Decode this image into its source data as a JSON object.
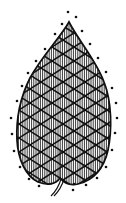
{
  "illustration": {
    "subject": "leaf-shaped crosshatch drawing with dotted outline",
    "colors": {
      "ink": "#111111",
      "background": "#ffffff"
    },
    "dots": [
      [
        68,
        12
      ],
      [
        76,
        17
      ],
      [
        62,
        24
      ],
      [
        82,
        31
      ],
      [
        55,
        34
      ],
      [
        90,
        44
      ],
      [
        45,
        49
      ],
      [
        98,
        58
      ],
      [
        36,
        61
      ],
      [
        106,
        72
      ],
      [
        28,
        73
      ],
      [
        112,
        88
      ],
      [
        22,
        86
      ],
      [
        116,
        103
      ],
      [
        17,
        101
      ],
      [
        117,
        118
      ],
      [
        11,
        118
      ],
      [
        115,
        133
      ],
      [
        12,
        134
      ],
      [
        112,
        150
      ],
      [
        14,
        151
      ],
      [
        106,
        167
      ],
      [
        20,
        167
      ],
      [
        97,
        178
      ],
      [
        29,
        179
      ],
      [
        86,
        185
      ],
      [
        39,
        186
      ],
      [
        74,
        184
      ],
      [
        73,
        190
      ]
    ]
  }
}
